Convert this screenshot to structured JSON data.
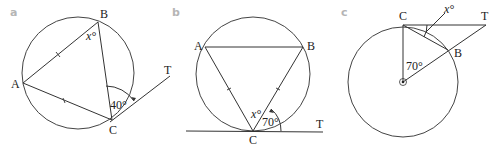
{
  "figure": {
    "parts": [
      {
        "id": "a",
        "label": "a",
        "points": {
          "A": "A",
          "B": "B",
          "C": "C",
          "T": "T"
        },
        "angles": {
          "unknown": "x°",
          "given": "40°"
        }
      },
      {
        "id": "b",
        "label": "b",
        "points": {
          "A": "A",
          "B": "B",
          "C": "C",
          "T": "T"
        },
        "angles": {
          "unknown": "x°",
          "given": "70°"
        }
      },
      {
        "id": "c",
        "label": "c",
        "points": {
          "C": "C",
          "B": "B",
          "T": "T"
        },
        "angles": {
          "unknown": "x°",
          "given": "70°"
        }
      }
    ],
    "colors": {
      "stroke": "#333333",
      "part_label": "#b5b5b5",
      "text": "#222222"
    }
  }
}
